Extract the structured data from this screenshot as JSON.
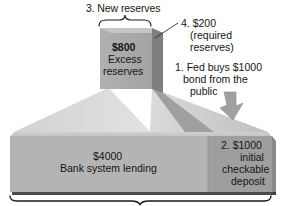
{
  "figure": {
    "colors": {
      "column_front": "#a8a8a8",
      "column_side_dark": "#7f7f7f",
      "platform_left": "#d8d8d8",
      "platform_right": "#c4c4c4",
      "base_front": "#b2b2b2",
      "base_top": "#c9c9c9",
      "deposit_front": "#9d9d9d",
      "arrow": "#9a9a9a",
      "text": "#151515",
      "background": "#ffffff"
    }
  },
  "annotations": {
    "new_reserves": "3. New reserves",
    "required_amount": "4. $200",
    "required_line1": "(required",
    "required_line2": "reserves)",
    "fed_line1": "1. Fed buys $1000",
    "fed_line2": "bond from the",
    "fed_line3": "public"
  },
  "column": {
    "amount": "$800",
    "label_line1": "Excess",
    "label_line2": "reserves"
  },
  "base": {
    "amount": "$4000",
    "label": "Bank system lending"
  },
  "deposit": {
    "line1": "2. $1000",
    "line2": "initial",
    "line3": "checkable",
    "line4": "deposit"
  },
  "icons": {
    "down_arrow": "down-right-arrow-icon",
    "top_brace": "curly-brace-up-icon",
    "bottom_brace": "curly-brace-down-icon",
    "leader_line": "leader-line-icon"
  }
}
